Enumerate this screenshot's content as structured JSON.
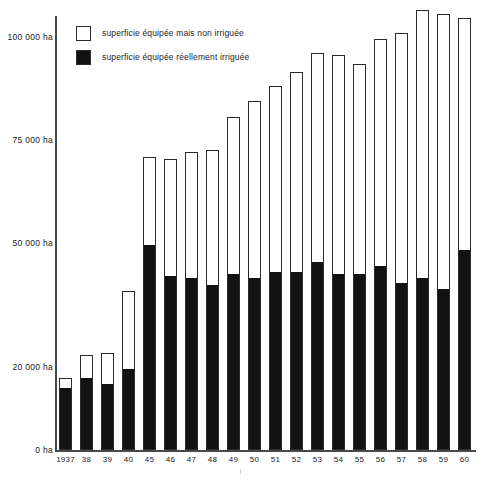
{
  "chart_data": {
    "type": "bar",
    "title": "",
    "subtitle": "",
    "xlabel": "",
    "ylabel": "",
    "stacked": true,
    "grid": false,
    "legend_position": "top-left",
    "ylim": [
      0,
      105000
    ],
    "y_ticks": [
      {
        "value": 0,
        "label": "0 ha"
      },
      {
        "value": 20000,
        "label": "20 000 ha"
      },
      {
        "value": 50000,
        "label": "50 000 ha"
      },
      {
        "value": 75000,
        "label": "75 000 ha"
      },
      {
        "value": 100000,
        "label": "100 000 ha"
      }
    ],
    "categories": [
      "1937",
      "38",
      "39",
      "40",
      "45",
      "46",
      "47",
      "48",
      "49",
      "50",
      "51",
      "52",
      "53",
      "54",
      "55",
      "56",
      "57",
      "58",
      "59",
      "60"
    ],
    "series": [
      {
        "name": "superficie équipée réellement irriguée",
        "color": "#121212",
        "values": [
          15000,
          17500,
          16000,
          19500,
          49500,
          42000,
          41500,
          40000,
          42500,
          41500,
          43000,
          43000,
          45500,
          42500,
          42500,
          44500,
          40500,
          41500,
          39000,
          48500
        ]
      },
      {
        "name": "superficie équipée mais non irriguée",
        "color": "#ffffff",
        "values": [
          2500,
          5500,
          7500,
          19000,
          21500,
          28500,
          30500,
          32500,
          38000,
          43000,
          45000,
          48500,
          50500,
          53000,
          51000,
          55000,
          60500,
          65000,
          66500,
          56000
        ]
      }
    ],
    "totals": [
      17500,
      23000,
      23500,
      38500,
      71000,
      70500,
      72000,
      72500,
      80500,
      84500,
      88000,
      91500,
      96000,
      95500,
      93500,
      99500,
      101000,
      106500,
      105500,
      104500
    ]
  },
  "legend": {
    "items": [
      {
        "key": "non-irriguee",
        "label": "superficie équipée mais non irriguée",
        "swatch": "empty"
      },
      {
        "key": "irriguee",
        "label": "superficie équipée réellement irriguée",
        "swatch": "filled"
      }
    ]
  }
}
